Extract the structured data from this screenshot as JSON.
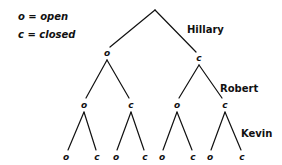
{
  "legend": {
    "open": "o = open",
    "closed": "c = closed"
  },
  "labels": {
    "hillary": "Hillary",
    "robert": "Robert",
    "kevin": "Kevin"
  },
  "tree": {
    "root": {
      "x": 155,
      "y": 10
    },
    "level1": [
      {
        "label": "o",
        "x": 107,
        "y": 53
      },
      {
        "label": "c",
        "x": 199,
        "y": 58
      }
    ],
    "level2": [
      {
        "label": "o",
        "x": 84,
        "y": 105
      },
      {
        "label": "c",
        "x": 131,
        "y": 105
      },
      {
        "label": "o",
        "x": 177,
        "y": 105
      },
      {
        "label": "c",
        "x": 225,
        "y": 105
      }
    ],
    "level3": [
      {
        "label": "o",
        "x": 66,
        "y": 157
      },
      {
        "label": "c",
        "x": 97,
        "y": 157
      },
      {
        "label": "o",
        "x": 116,
        "y": 157
      },
      {
        "label": "c",
        "x": 145,
        "y": 157
      },
      {
        "label": "o",
        "x": 162,
        "y": 157
      },
      {
        "label": "c",
        "x": 193,
        "y": 157
      },
      {
        "label": "o",
        "x": 210,
        "y": 157
      },
      {
        "label": "c",
        "x": 242,
        "y": 157
      }
    ]
  },
  "colors": {
    "line": "#111111",
    "text": "#111111",
    "background": "#ffffff"
  }
}
